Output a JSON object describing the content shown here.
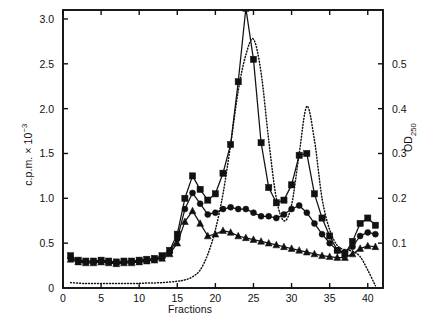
{
  "figure": {
    "axis_left_label": "c.p.m. × 10",
    "axis_left_exponent": "−3",
    "axis_right_label": "OD",
    "axis_right_subscript": "250",
    "axis_x_label": "Fractions",
    "line_color": "#111111",
    "background": "#ffffff"
  },
  "chart_data": {
    "type": "line",
    "title": "",
    "xlabel": "Fractions",
    "ylabel": "c.p.m. × 10⁻³",
    "ylabel_right": "OD250",
    "xlim": [
      0,
      42
    ],
    "ylim": [
      0,
      3.1
    ],
    "ylim_right": [
      0,
      0.62
    ],
    "grid": false,
    "legend": "none",
    "xticks": [
      0,
      5,
      10,
      15,
      20,
      25,
      30,
      35,
      40
    ],
    "xticklabels": [
      "0",
      "5",
      "10",
      "15",
      "20",
      "25",
      "30",
      "35",
      "40"
    ],
    "yticks": [
      0,
      0.5,
      1.0,
      1.5,
      2.0,
      2.5,
      3.0
    ],
    "yticklabels": [
      "0",
      "0.5",
      "1.0",
      "1.5",
      "2.0",
      "2.5",
      "3.0"
    ],
    "yticks_right": [
      0.1,
      0.2,
      0.3,
      0.4,
      0.5
    ],
    "yticklabels_right": [
      "0.1",
      "0.2",
      "0.3",
      "0.4",
      "0.5"
    ],
    "series": [
      {
        "name": "c.p.m. series 1",
        "marker": "square",
        "linestyle": "solid",
        "axis": "left",
        "x": [
          1,
          2,
          3,
          4,
          5,
          6,
          7,
          8,
          9,
          10,
          11,
          12,
          13,
          14,
          15,
          16,
          17,
          18,
          19,
          20,
          21,
          22,
          23,
          24,
          25,
          26,
          27,
          28,
          29,
          30,
          31,
          32,
          33,
          34,
          35,
          36,
          37,
          38,
          39,
          40,
          41
        ],
        "y": [
          0.36,
          0.31,
          0.3,
          0.3,
          0.31,
          0.3,
          0.29,
          0.3,
          0.3,
          0.31,
          0.32,
          0.33,
          0.36,
          0.42,
          0.6,
          1.0,
          1.25,
          1.1,
          0.98,
          1.05,
          1.28,
          1.6,
          2.3,
          3.12,
          2.55,
          1.62,
          1.12,
          0.95,
          0.98,
          1.15,
          1.48,
          1.5,
          1.05,
          0.78,
          0.58,
          0.42,
          0.38,
          0.52,
          0.72,
          0.78,
          0.7
        ]
      },
      {
        "name": "c.p.m. series 2",
        "marker": "circle",
        "linestyle": "solid",
        "axis": "left",
        "x": [
          1,
          2,
          3,
          4,
          5,
          6,
          7,
          8,
          9,
          10,
          11,
          12,
          13,
          14,
          15,
          16,
          17,
          18,
          19,
          20,
          21,
          22,
          23,
          24,
          25,
          26,
          27,
          28,
          29,
          30,
          31,
          32,
          33,
          34,
          35,
          36,
          37,
          38,
          39,
          40,
          41
        ],
        "y": [
          0.33,
          0.3,
          0.29,
          0.29,
          0.3,
          0.29,
          0.28,
          0.29,
          0.29,
          0.3,
          0.31,
          0.32,
          0.34,
          0.4,
          0.55,
          0.88,
          1.06,
          0.94,
          0.82,
          0.84,
          0.88,
          0.9,
          0.88,
          0.88,
          0.84,
          0.8,
          0.8,
          0.78,
          0.82,
          0.88,
          0.92,
          0.84,
          0.72,
          0.6,
          0.5,
          0.42,
          0.4,
          0.46,
          0.58,
          0.62,
          0.6
        ]
      },
      {
        "name": "c.p.m. series 3",
        "marker": "triangle",
        "linestyle": "solid",
        "axis": "left",
        "x": [
          1,
          2,
          3,
          4,
          5,
          6,
          7,
          8,
          9,
          10,
          11,
          12,
          13,
          14,
          15,
          16,
          17,
          18,
          19,
          20,
          21,
          22,
          23,
          24,
          25,
          26,
          27,
          28,
          29,
          30,
          31,
          32,
          33,
          34,
          35,
          36,
          37,
          38,
          39,
          40,
          41
        ],
        "y": [
          0.32,
          0.29,
          0.28,
          0.28,
          0.29,
          0.28,
          0.27,
          0.28,
          0.28,
          0.29,
          0.3,
          0.31,
          0.33,
          0.38,
          0.5,
          0.74,
          0.86,
          0.72,
          0.58,
          0.6,
          0.64,
          0.62,
          0.58,
          0.56,
          0.54,
          0.52,
          0.5,
          0.48,
          0.46,
          0.44,
          0.42,
          0.4,
          0.38,
          0.36,
          0.35,
          0.34,
          0.34,
          0.38,
          0.44,
          0.47,
          0.46
        ]
      },
      {
        "name": "OD250",
        "marker": "none",
        "linestyle": "dotted",
        "axis": "right",
        "x": [
          1,
          3,
          5,
          7,
          9,
          11,
          13,
          15,
          16,
          17,
          18,
          19,
          20,
          21,
          22,
          23,
          24,
          25,
          26,
          27,
          28,
          29,
          30,
          31,
          32,
          33,
          34,
          35,
          36,
          37,
          38,
          39,
          40,
          41
        ],
        "y": [
          0.012,
          0.01,
          0.01,
          0.01,
          0.01,
          0.011,
          0.012,
          0.015,
          0.018,
          0.025,
          0.04,
          0.075,
          0.13,
          0.21,
          0.32,
          0.44,
          0.52,
          0.555,
          0.48,
          0.33,
          0.2,
          0.15,
          0.185,
          0.3,
          0.405,
          0.33,
          0.2,
          0.13,
          0.095,
          0.085,
          0.082,
          0.07,
          0.04,
          0.005
        ]
      }
    ]
  }
}
